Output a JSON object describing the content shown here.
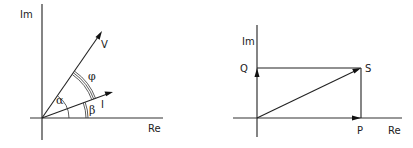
{
  "figure": {
    "left_panel": {
      "title": "Voltage and current phasors",
      "axes": {
        "x_label": "Re",
        "y_label": "Im"
      },
      "vectors": [
        {
          "name": "V",
          "label": "V",
          "angle_deg": 55
        },
        {
          "name": "I",
          "label": "I",
          "angle_deg": 20
        }
      ],
      "angles": [
        {
          "symbol": "α",
          "between": [
            "Re",
            "V"
          ]
        },
        {
          "symbol": "φ",
          "between": [
            "I",
            "V"
          ]
        },
        {
          "symbol": "β",
          "between": [
            "Re",
            "I"
          ]
        }
      ]
    },
    "right_panel": {
      "title": "Complex power triangle",
      "axes": {
        "x_label": "Re",
        "y_label": "Im"
      },
      "vectors": [
        {
          "name": "S",
          "label": "S"
        },
        {
          "name": "P",
          "label": "P"
        },
        {
          "name": "Q",
          "label": "Q"
        }
      ]
    },
    "colors": {
      "line": "#222222",
      "background": "#ffffff"
    }
  }
}
